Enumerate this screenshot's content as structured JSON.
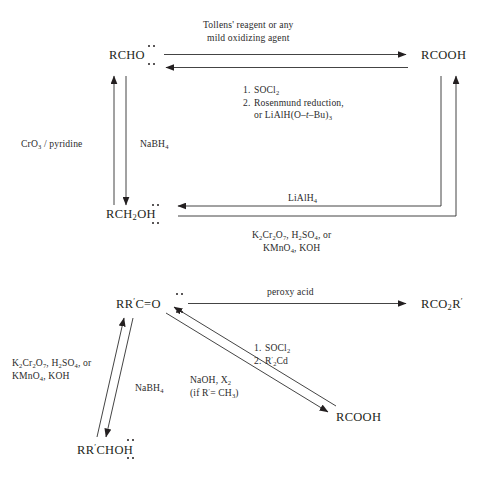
{
  "diagram": {
    "top_scheme": {
      "species": {
        "aldehyde": "RCHO",
        "carboxylic_acid": "RCOOH",
        "primary_alcohol": "RCH2OH"
      },
      "reagents": {
        "oxidation_top_line1": "Tollens' reagent or any",
        "oxidation_top_line2": "mild oxidizing agent",
        "reduction_step1": "SOCl2",
        "reduction_step1_num": "1.",
        "reduction_step2_num": "2.",
        "reduction_step2a": "Rosenmund reduction,",
        "reduction_step2b_pre": "or LiAlH(O–",
        "reduction_step2b_ital": "t",
        "reduction_step2b_post": "–Bu)3",
        "chromium_pyridine": "CrO3 / pyridine",
        "sodium_borohydride": "NaBH4",
        "lithium_aluminium_hydride": "LiAlH4",
        "oxidation_bottom_line1": "K2Cr2O7, H2SO4, or",
        "oxidation_bottom_line2": "KMnO4, KOH"
      }
    },
    "bottom_scheme": {
      "species": {
        "ketone": "RR'C=O",
        "ester": "RCO2R'",
        "carboxylic_acid": "RCOOH",
        "secondary_alcohol": "RR'CHOH"
      },
      "reagents": {
        "peroxy_acid": "peroxy acid",
        "acyl_step1_num": "1.",
        "acyl_step1": "SOCl2",
        "acyl_step2_num": "2.",
        "acyl_step2": "R'2Cd",
        "haloform_line1": "NaOH, X2",
        "haloform_line2": "(if R' = CH3)",
        "sodium_borohydride": "NaBH4",
        "oxidation_line1": "K2Cr2O7, H2SO4, or",
        "oxidation_line2": "KMnO4, KOH"
      }
    },
    "colors": {
      "ink": "#231f20",
      "background": "#ffffff",
      "line": "#3a3a3a"
    }
  }
}
